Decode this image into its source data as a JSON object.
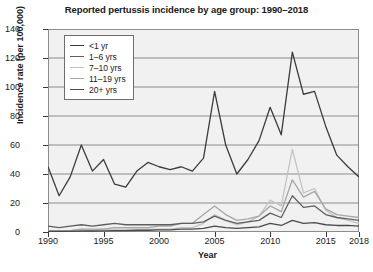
{
  "chart_data": {
    "type": "line",
    "title": "Reported pertussis incidence by age group: 1990–2018",
    "xlabel": "Year",
    "ylabel": "Incidence rate (per 100,000)",
    "xlim": [
      1990,
      2018
    ],
    "ylim": [
      0,
      140
    ],
    "yticks": [
      0,
      20,
      40,
      60,
      80,
      100,
      120,
      140
    ],
    "xticks": [
      1990,
      1995,
      2000,
      2005,
      2010,
      2015,
      2018
    ],
    "grid": true,
    "legend_position": "upper-left",
    "x": [
      1990,
      1991,
      1992,
      1993,
      1994,
      1995,
      1996,
      1997,
      1998,
      1999,
      2000,
      2001,
      2002,
      2003,
      2004,
      2005,
      2006,
      2007,
      2008,
      2009,
      2010,
      2011,
      2012,
      2013,
      2014,
      2015,
      2016,
      2017,
      2018
    ],
    "series": [
      {
        "name": "<1 yr",
        "color": "#3c3c3c",
        "values": [
          45,
          25,
          38,
          60,
          42,
          50,
          33,
          31,
          42,
          48,
          45,
          43,
          45,
          42,
          51,
          97,
          60,
          40,
          50,
          63,
          86,
          67,
          124,
          95,
          97,
          73,
          53,
          45,
          38
        ]
      },
      {
        "name": "1–6 yrs",
        "color": "#5f5f5f",
        "values": [
          4,
          3,
          4,
          5,
          4,
          5,
          6,
          5,
          5,
          5,
          5,
          5,
          6,
          6,
          7,
          11,
          8,
          6,
          7,
          8,
          13,
          10,
          25,
          17,
          18,
          12,
          10,
          9,
          8
        ]
      },
      {
        "name": "7–10 yrs",
        "color": "#c3c3c3",
        "values": [
          1,
          1,
          1,
          2,
          1,
          2,
          2,
          2,
          2,
          2,
          2,
          2,
          3,
          3,
          6,
          12,
          8,
          5,
          7,
          11,
          22,
          18,
          57,
          27,
          30,
          15,
          10,
          8,
          6
        ]
      },
      {
        "name": "11–19 yrs",
        "color": "#a6a6a6",
        "values": [
          1,
          1,
          1,
          2,
          2,
          2,
          3,
          3,
          3,
          3,
          4,
          4,
          6,
          6,
          12,
          18,
          12,
          8,
          9,
          11,
          18,
          14,
          36,
          24,
          28,
          16,
          12,
          11,
          10
        ]
      },
      {
        "name": "20+ yrs",
        "color": "#4a4a4a",
        "values": [
          0.5,
          0.4,
          0.5,
          0.7,
          0.7,
          0.8,
          1,
          1,
          1.2,
          1.2,
          1.5,
          1.5,
          2,
          2,
          2.5,
          4,
          3,
          2.5,
          3,
          3.5,
          6,
          4.5,
          8,
          6,
          6.5,
          5,
          4.5,
          4.5,
          4
        ]
      }
    ]
  }
}
